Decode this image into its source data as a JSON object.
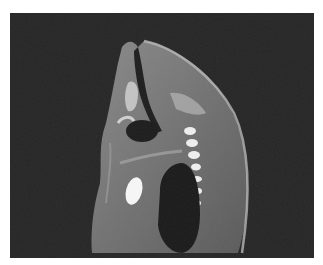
{
  "image": {
    "kind": "MRI scan, sagittal view",
    "caption": "",
    "colors": {
      "background": "#ffffff",
      "scan_background": "#262626",
      "soft_tissue": "#6e6e6e",
      "bright_tissue": "#d8d8d8",
      "dark_cavity": "#1a1a1a",
      "fluid": "#f5f5f5"
    }
  }
}
